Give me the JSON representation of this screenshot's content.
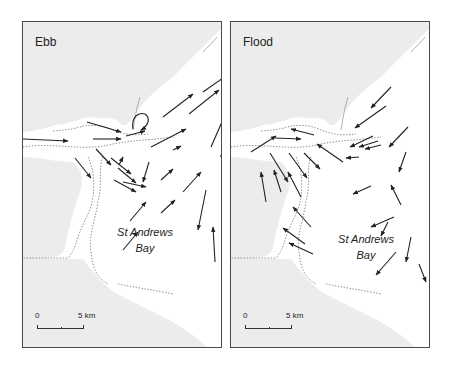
{
  "figure": {
    "colors": {
      "land": "#ececec",
      "sea": "#ffffff",
      "arrow": "#222222",
      "frame": "#4a4a4a",
      "dotted": "#777777"
    },
    "panels": [
      {
        "id": "ebb",
        "title": "Ebb",
        "place_label_line1": "St Andrews",
        "place_label_line2": "Bay",
        "scale": {
          "zero": "0",
          "five": "5 km"
        },
        "arrows": [
          [
            0,
            117,
            45,
            119
          ],
          [
            70,
            117,
            98,
            117
          ],
          [
            64,
            100,
            98,
            110
          ],
          [
            96,
            143,
            100,
            135
          ],
          [
            88,
            136,
            108,
            152
          ],
          [
            73,
            127,
            88,
            143
          ],
          [
            52,
            136,
            68,
            156
          ],
          [
            95,
            146,
            113,
            161
          ],
          [
            126,
            140,
            120,
            160
          ],
          [
            100,
            160,
            123,
            165
          ],
          [
            138,
            158,
            150,
            147
          ],
          [
            128,
            125,
            163,
            107
          ],
          [
            140,
            95,
            170,
            72
          ],
          [
            180,
            70,
            207,
            51
          ],
          [
            166,
            92,
            196,
            68
          ],
          [
            188,
            125,
            202,
            93
          ],
          [
            200,
            164,
            199,
            130
          ],
          [
            183,
            168,
            175,
            208
          ],
          [
            192,
            240,
            190,
            205
          ],
          [
            91,
            158,
            113,
            170
          ],
          [
            160,
            170,
            178,
            150
          ],
          [
            107,
            199,
            123,
            180
          ],
          [
            138,
            191,
            152,
            178
          ],
          [
            100,
            228,
            115,
            210
          ],
          [
            150,
            128,
            158,
            124
          ],
          [
            103,
            114,
            122,
            109
          ]
        ],
        "arrows_note": "panel-local coordinates x1,y1 -> x2,y2 (head at x2,y2)"
      },
      {
        "id": "flood",
        "title": "Flood",
        "place_label_line1": "St Andrews",
        "place_label_line2": "Bay",
        "scale": {
          "zero": "0",
          "five": "5 km"
        },
        "arrows": [
          [
            112,
            140,
            86,
            122
          ],
          [
            83,
            113,
            60,
            107
          ],
          [
            44,
            116,
            70,
            117
          ],
          [
            20,
            130,
            45,
            114
          ],
          [
            39,
            131,
            57,
            160
          ],
          [
            58,
            131,
            76,
            156
          ],
          [
            73,
            131,
            89,
            147
          ],
          [
            142,
            114,
            119,
            125
          ],
          [
            128,
            135,
            115,
            136
          ],
          [
            147,
            119,
            128,
            125
          ],
          [
            150,
            123,
            134,
            127
          ],
          [
            160,
            65,
            140,
            86
          ],
          [
            155,
            84,
            124,
            106
          ],
          [
            177,
            105,
            158,
            125
          ],
          [
            175,
            130,
            168,
            150
          ],
          [
            140,
            164,
            122,
            172
          ],
          [
            170,
            183,
            160,
            163
          ],
          [
            163,
            195,
            140,
            205
          ],
          [
            157,
            200,
            150,
            214
          ],
          [
            180,
            215,
            175,
            240
          ],
          [
            188,
            242,
            195,
            260
          ],
          [
            165,
            230,
            145,
            253
          ],
          [
            82,
            232,
            58,
            221
          ],
          [
            74,
            222,
            52,
            206
          ],
          [
            80,
            205,
            62,
            185
          ],
          [
            35,
            180,
            30,
            150
          ],
          [
            50,
            170,
            43,
            148
          ],
          [
            70,
            175,
            57,
            150
          ]
        ]
      }
    ]
  }
}
